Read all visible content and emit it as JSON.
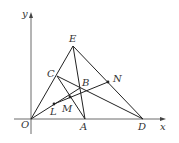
{
  "diagram": {
    "type": "coordinate-geometry",
    "axes": {
      "x_label": "x",
      "y_label": "y",
      "origin_label": "O"
    },
    "points": [
      {
        "id": "O",
        "label": "O",
        "x": 31,
        "y": 119,
        "lx": 21,
        "ly": 128
      },
      {
        "id": "A",
        "label": "A",
        "x": 85,
        "y": 119,
        "lx": 80,
        "ly": 130
      },
      {
        "id": "D",
        "label": "D",
        "x": 143,
        "y": 119,
        "lx": 138,
        "ly": 130
      },
      {
        "id": "E",
        "label": "E",
        "x": 73,
        "y": 46,
        "lx": 69,
        "ly": 42
      },
      {
        "id": "C",
        "label": "C",
        "x": 57,
        "y": 76,
        "lx": 47,
        "ly": 77
      },
      {
        "id": "B",
        "label": "B",
        "x": 80,
        "y": 88,
        "lx": 82,
        "ly": 86
      },
      {
        "id": "N",
        "label": "N",
        "x": 108,
        "y": 82,
        "lx": 113,
        "ly": 82
      },
      {
        "id": "L",
        "label": "L",
        "x": 54,
        "y": 104,
        "lx": 50,
        "ly": 115
      },
      {
        "id": "M",
        "label": "M",
        "x": 70,
        "y": 97,
        "lx": 62,
        "ly": 112
      }
    ],
    "segments": [
      [
        "O",
        "E"
      ],
      [
        "E",
        "A"
      ],
      [
        "E",
        "D"
      ],
      [
        "C",
        "A"
      ],
      [
        "C",
        "D"
      ],
      [
        "O",
        "B"
      ],
      [
        "L",
        "N"
      ]
    ],
    "colors": {
      "line": "#222222",
      "axis": "#444444",
      "label": "#333333"
    }
  }
}
